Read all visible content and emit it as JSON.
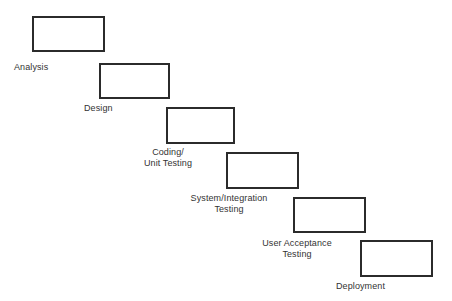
{
  "diagram": {
    "type": "waterfall-staircase",
    "background_color": "#ffffff",
    "box_border_color": "#2b2b2b",
    "box_fill_color": "#ffffff",
    "label_color": "#333333",
    "stages": [
      {
        "id": "analysis",
        "label": "Analysis",
        "label_lines": [
          "Analysis"
        ],
        "label_align": "left",
        "box": {
          "x": 32,
          "y": 16,
          "width": 73,
          "height": 36
        },
        "label_pos": {
          "x": 14,
          "y": 62,
          "width": 62
        }
      },
      {
        "id": "design",
        "label": "Design",
        "label_lines": [
          "Design"
        ],
        "label_align": "left",
        "box": {
          "x": 99,
          "y": 63,
          "width": 71,
          "height": 36
        },
        "label_pos": {
          "x": 84,
          "y": 103,
          "width": 62
        }
      },
      {
        "id": "coding-unit-testing",
        "label": "Coding/ Unit Testing",
        "label_lines": [
          "Coding/",
          "Unit Testing"
        ],
        "label_align": "center",
        "box": {
          "x": 166,
          "y": 107,
          "width": 69,
          "height": 37
        },
        "label_pos": {
          "x": 134,
          "y": 147,
          "width": 68
        }
      },
      {
        "id": "system-integration-testing",
        "label": "System/Integration Testing",
        "label_lines": [
          "System/Integration",
          "Testing"
        ],
        "label_align": "center",
        "box": {
          "x": 226,
          "y": 152,
          "width": 73,
          "height": 37
        },
        "label_pos": {
          "x": 185,
          "y": 193,
          "width": 88
        }
      },
      {
        "id": "user-acceptance-testing",
        "label": "User Acceptance Testing",
        "label_lines": [
          "User Acceptance",
          "Testing"
        ],
        "label_align": "center",
        "box": {
          "x": 293,
          "y": 197,
          "width": 73,
          "height": 36
        },
        "label_pos": {
          "x": 255,
          "y": 238,
          "width": 84
        }
      },
      {
        "id": "deployment",
        "label": "Deployment",
        "label_lines": [
          "Deployment"
        ],
        "label_align": "left",
        "box": {
          "x": 360,
          "y": 240,
          "width": 73,
          "height": 37
        },
        "label_pos": {
          "x": 336,
          "y": 281,
          "width": 74
        }
      }
    ]
  }
}
